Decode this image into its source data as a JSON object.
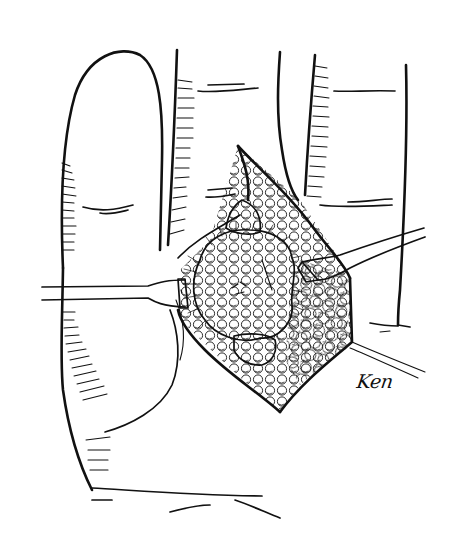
{
  "illustration": {
    "subject": "surgical-exposure-of-hand-with-retractors",
    "style": "black-and-white pen-and-ink line drawing",
    "background_color": "#ffffff",
    "ink_color": "#111111",
    "signature": "Ken"
  }
}
